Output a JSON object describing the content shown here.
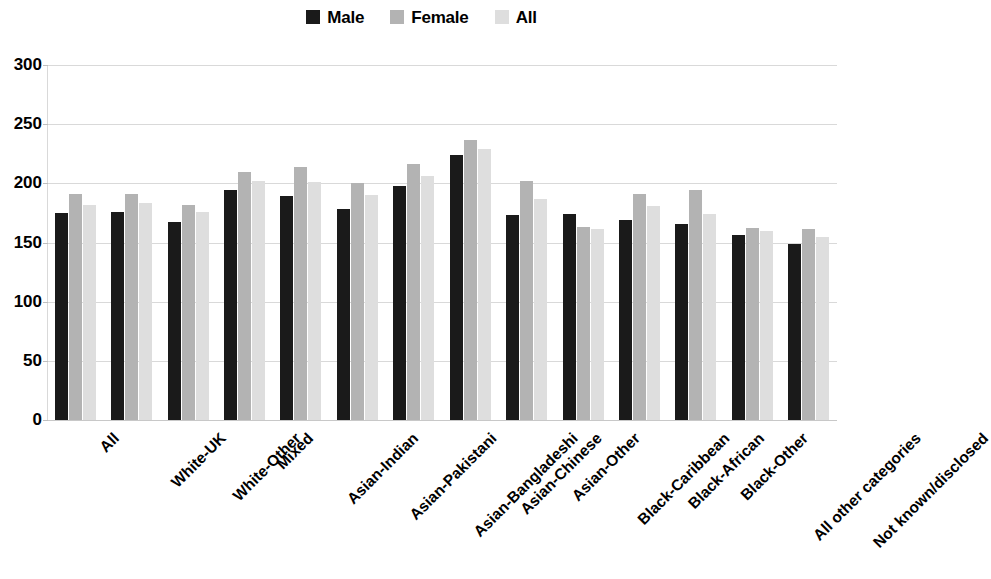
{
  "legend": {
    "entries": [
      {
        "label": "Male",
        "color": "#1a1a1a"
      },
      {
        "label": "Female",
        "color": "#b3b3b3"
      },
      {
        "label": "All",
        "color": "#dedede"
      }
    ]
  },
  "axes": {
    "y_ticks": [
      "0",
      "50",
      "100",
      "150",
      "200",
      "250",
      "300"
    ]
  },
  "chart_data": {
    "type": "bar",
    "title": "",
    "subtitle": "",
    "xlabel": "",
    "ylabel": "",
    "ylim": [
      0,
      300
    ],
    "ytick_values": [
      0,
      50,
      100,
      150,
      200,
      250,
      300
    ],
    "grid": true,
    "legend_position": "top-center",
    "categories": [
      "All",
      "White-UK",
      "White-Other",
      "Mixed",
      "Asian-Indian",
      "Asian-Pakistani",
      "Asian-Bangladeshi",
      "Asian-Chinese",
      "Asian-Other",
      "Black-Caribbean",
      "Black-African",
      "Black-Other",
      "All other categories",
      "Not known/disclosed"
    ],
    "series": [
      {
        "name": "Male",
        "color": "#1a1a1a",
        "values": [
          175,
          176,
          167,
          194,
          189,
          178,
          198,
          224,
          173,
          174,
          169,
          166,
          156,
          149
        ]
      },
      {
        "name": "Female",
        "color": "#b3b3b3",
        "values": [
          191,
          191,
          182,
          210,
          214,
          200,
          216,
          237,
          202,
          163,
          191,
          194,
          162,
          161
        ]
      },
      {
        "name": "All",
        "color": "#dedede",
        "values": [
          182,
          183,
          176,
          202,
          201,
          190,
          206,
          229,
          187,
          161,
          181,
          174,
          160,
          155
        ]
      }
    ]
  }
}
